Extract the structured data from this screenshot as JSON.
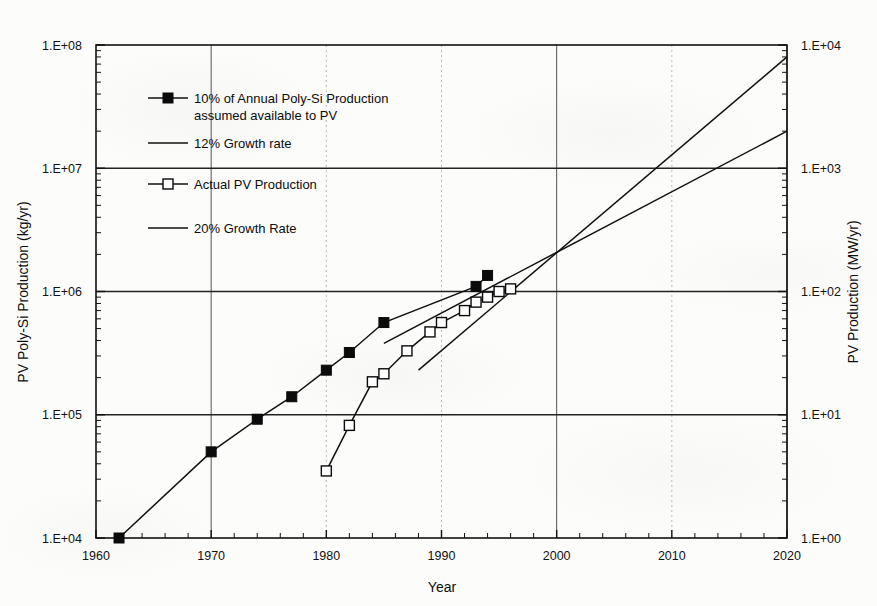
{
  "chart_data": {
    "type": "line",
    "title": "",
    "xlabel": "Year",
    "ylabel": "PV Poly-Si Production (kg/yr)",
    "y2label": "PV Production (MW/yr)",
    "xlim": [
      1960,
      2020
    ],
    "ylim": [
      10000,
      100000000
    ],
    "y2lim": [
      1,
      10000
    ],
    "yscale": "log",
    "y2scale": "log",
    "grid": true,
    "legend_position": "upper-left-inside",
    "xticks": [
      "1960",
      "1970",
      "1980",
      "1990",
      "2000",
      "2010",
      "2020"
    ],
    "xtick_values": [
      1960,
      1970,
      1980,
      1990,
      2000,
      2010,
      2020
    ],
    "xtick_minor_step": 2,
    "yticks": [
      "1.E+04",
      "1.E+05",
      "1.E+06",
      "1.E+07",
      "1.E+08"
    ],
    "ytick_values": [
      10000,
      100000,
      1000000,
      10000000,
      100000000
    ],
    "y2ticks": [
      "1.E+00",
      "1.E+01",
      "1.E+02",
      "1.E+03",
      "1.E+04"
    ],
    "y2tick_values": [
      1,
      10,
      100,
      1000,
      10000
    ],
    "series": [
      {
        "name": "10% of Annual Poly-Si Production assumed available to PV",
        "marker": "filled-square",
        "x": [
          1962,
          1970,
          1974,
          1977,
          1980,
          1982,
          1985,
          1993,
          1994
        ],
        "values": [
          10000,
          50000,
          92000,
          140000,
          230000,
          320000,
          560000,
          1100000,
          1350000
        ]
      },
      {
        "name": "Actual PV Production",
        "marker": "open-square",
        "x": [
          1980,
          1982,
          1984,
          1985,
          1987,
          1989,
          1990,
          1992,
          1993,
          1994,
          1995,
          1996
        ],
        "values": [
          35000,
          82000,
          185000,
          215000,
          330000,
          470000,
          560000,
          700000,
          820000,
          900000,
          1000000,
          1050000
        ]
      },
      {
        "name": "12% Growth rate",
        "marker": "none",
        "x": [
          1985,
          2020
        ],
        "values": [
          380000,
          20000000
        ]
      },
      {
        "name": "20% Growth Rate",
        "marker": "none",
        "x": [
          1988,
          2020
        ],
        "values": [
          230000,
          80000000
        ]
      }
    ]
  },
  "legend": {
    "items": [
      {
        "label_line1": "10% of Annual Poly-Si Production",
        "label_line2": "assumed available to PV",
        "marker": "filled-square"
      },
      {
        "label_line1": "12% Growth rate",
        "label_line2": "",
        "marker": "line"
      },
      {
        "label_line1": "Actual PV Production",
        "label_line2": "",
        "marker": "open-square"
      },
      {
        "label_line1": "20% Growth Rate",
        "label_line2": "",
        "marker": "line"
      }
    ]
  },
  "axes": {
    "x_title": "Year",
    "y_left_title": "PV Poly-Si Production (kg/yr)",
    "y_right_title": "PV Production (MW/yr)"
  },
  "colors": {
    "ink": "#111111",
    "grid": "#555555",
    "minor_grid": "#bbbbbb",
    "background": "#fcfcfb"
  }
}
